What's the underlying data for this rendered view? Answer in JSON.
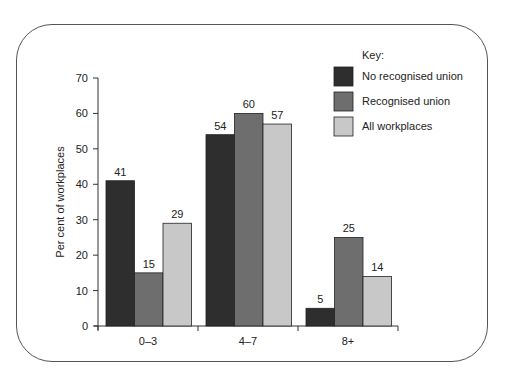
{
  "chart_data": {
    "type": "bar",
    "title": "",
    "xlabel": "",
    "ylabel": "Per cent of workplaces",
    "ylim": [
      0,
      70
    ],
    "yticks": [
      0,
      10,
      20,
      30,
      40,
      50,
      60,
      70
    ],
    "grid": false,
    "legend_position": "top-right",
    "legend_title": "Key:",
    "categories": [
      "0–3",
      "4–7",
      "8+"
    ],
    "series": [
      {
        "name": "No recognised union",
        "color": "#2e2e2e",
        "values": [
          41,
          54,
          5
        ]
      },
      {
        "name": "Recognised union",
        "color": "#6e6e6e",
        "values": [
          15,
          60,
          25
        ]
      },
      {
        "name": "All workplaces",
        "color": "#c8c8c8",
        "values": [
          29,
          57,
          14
        ]
      }
    ]
  }
}
